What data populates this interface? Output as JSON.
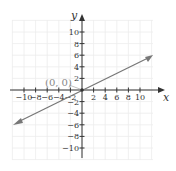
{
  "graph": {
    "x_axis_label": "x",
    "y_axis_label": "y",
    "x_ticks": [
      "-10",
      "-8",
      "-6",
      "-4",
      "-2",
      "2",
      "4",
      "6",
      "8",
      "10"
    ],
    "y_ticks": [
      "10",
      "8",
      "6",
      "4",
      "2",
      "-2",
      "-4",
      "-6",
      "-8",
      "-10"
    ],
    "point_label": "(0, 0)",
    "line_color": "#777777",
    "grid_color": "#eeeeee",
    "axis_color": "#333333"
  },
  "chart_data": {
    "type": "line",
    "title": "",
    "xlabel": "x",
    "ylabel": "y",
    "xlim": [
      -12,
      12
    ],
    "ylim": [
      -12,
      12
    ],
    "grid": true,
    "series": [
      {
        "name": "y = x/2",
        "x": [
          -12,
          12
        ],
        "y": [
          -6,
          6
        ]
      }
    ],
    "annotations": [
      {
        "text": "(0, 0)",
        "x": 0,
        "y": 0
      }
    ]
  }
}
